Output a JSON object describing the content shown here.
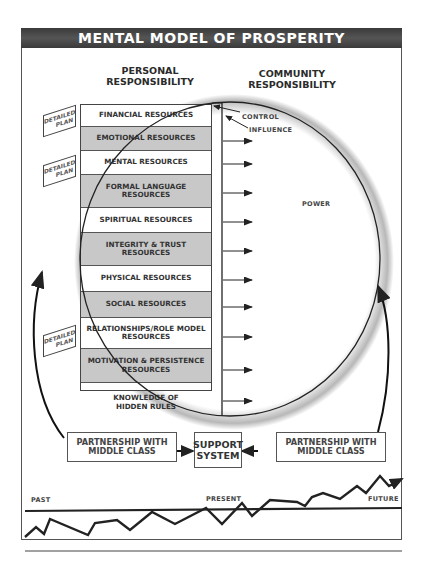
{
  "title": "MENTAL MODEL OF PROSPERITY",
  "headers": {
    "personal": [
      "PERSONAL",
      "RESPONSIBILITY"
    ],
    "community": [
      "COMMUNITY",
      "RESPONSIBILITY"
    ]
  },
  "resources": [
    {
      "label": "FINANCIAL RESOURCES",
      "shaded": false
    },
    {
      "label": "EMOTIONAL RESOURCES",
      "shaded": true
    },
    {
      "label": "MENTAL RESOURCES",
      "shaded": false
    },
    {
      "label": "FORMAL LANGUAGE RESOURCES",
      "shaded": true
    },
    {
      "label": "SPIRITUAL RESOURCES",
      "shaded": false
    },
    {
      "label": "INTEGRITY & TRUST RESOURCES",
      "shaded": true
    },
    {
      "label": "PHYSICAL RESOURCES",
      "shaded": false
    },
    {
      "label": "SOCIAL RESOURCES",
      "shaded": true
    },
    {
      "label": "RELATIONSHIPS/ROLE MODEL RESOURCES",
      "shaded": false
    },
    {
      "label": "MOTIVATION & PERSISTENCE RESOURCES",
      "shaded": true
    }
  ],
  "hidden_rules": [
    "KNOWLEDGE OF",
    "HIDDEN RULES"
  ],
  "detailed_plan": [
    "DETAILED",
    "PLAN"
  ],
  "circle_labels": {
    "control": "CONTROL",
    "influence": "INFLUENCE",
    "power": "POWER"
  },
  "bottom_boxes": {
    "left": [
      "PARTNERSHIP WITH",
      "MIDDLE CLASS"
    ],
    "center": [
      "SUPPORT",
      "SYSTEM"
    ],
    "right": [
      "PARTNERSHIP WITH",
      "MIDDLE CLASS"
    ]
  },
  "timeline": {
    "past": "PAST",
    "present": "PRESENT",
    "future": "FUTURE"
  }
}
